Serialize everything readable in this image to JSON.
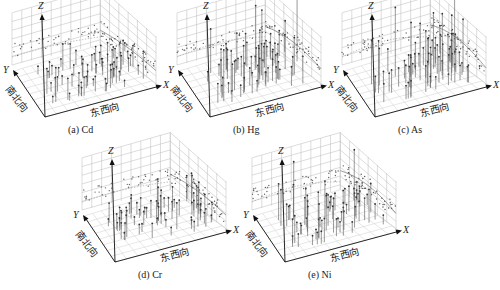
{
  "chart_data": [
    {
      "type": "scatter",
      "title": "(a) Cd",
      "panel_label": "(a)",
      "element": "Cd",
      "axes": {
        "x": "X",
        "y": "Y",
        "z": "Z"
      },
      "xlabel": "东西向",
      "ylabel": "南北向",
      "zlabel": "Z",
      "grid": true,
      "description": "3D trend analysis: sample points with vertical stems; projections on back walls show trend curves",
      "relative_stem_height": "low",
      "trend_xz": "slight downward arc",
      "trend_yz": "flat"
    },
    {
      "type": "scatter",
      "title": "(b) Hg",
      "panel_label": "(b)",
      "element": "Hg",
      "axes": {
        "x": "X",
        "y": "Y",
        "z": "Z"
      },
      "xlabel": "东西向",
      "ylabel": "南北向",
      "zlabel": "Z",
      "grid": true,
      "relative_stem_height": "high",
      "trend_xz": "inverted-U arc",
      "trend_yz": "rising"
    },
    {
      "type": "scatter",
      "title": "(c) As",
      "panel_label": "(c)",
      "element": "As",
      "axes": {
        "x": "X",
        "y": "Y",
        "z": "Z"
      },
      "xlabel": "东西向",
      "ylabel": "南北向",
      "zlabel": "Z",
      "grid": true,
      "relative_stem_height": "high",
      "trend_xz": "inverted-U arc",
      "trend_yz": "inverted-U arc"
    },
    {
      "type": "scatter",
      "title": "(d) Cr",
      "panel_label": "(d)",
      "element": "Cr",
      "axes": {
        "x": "X",
        "y": "Y",
        "z": "Z"
      },
      "xlabel": "东西向",
      "ylabel": "南北向",
      "zlabel": "Z",
      "grid": true,
      "relative_stem_height": "low",
      "trend_xz": "slight inverted-U arc",
      "trend_yz": "flat"
    },
    {
      "type": "scatter",
      "title": "(e) Ni",
      "panel_label": "(e)",
      "element": "Ni",
      "axes": {
        "x": "X",
        "y": "Y",
        "z": "Z"
      },
      "xlabel": "东西向",
      "ylabel": "南北向",
      "zlabel": "Z",
      "grid": true,
      "relative_stem_height": "medium",
      "trend_xz": "inverted-U arc, dropping toward X",
      "trend_yz": "flat"
    }
  ],
  "panels": [
    {
      "id": "a",
      "caption": "(a)  Cd",
      "x_label": "X",
      "y_label": "Y",
      "z_label": "Z",
      "ew_label": "东西向",
      "ns_label": "南北向",
      "left": 0,
      "top": 0,
      "stem_scale": 0.45,
      "seed": 11,
      "trend": 0.15
    },
    {
      "id": "b",
      "caption": "(b)  Hg",
      "x_label": "X",
      "y_label": "Y",
      "z_label": "Z",
      "ew_label": "东西向",
      "ns_label": "南北向",
      "left": 165,
      "top": 0,
      "stem_scale": 0.85,
      "seed": 23,
      "trend": 0.35
    },
    {
      "id": "c",
      "caption": "(c)  As",
      "x_label": "X",
      "y_label": "Y",
      "z_label": "Z",
      "ew_label": "东西向",
      "ns_label": "南北向",
      "left": 330,
      "top": 0,
      "stem_scale": 0.95,
      "seed": 37,
      "trend": 0.45
    },
    {
      "id": "d",
      "caption": "(d)  Cr",
      "x_label": "X",
      "y_label": "Y",
      "z_label": "Z",
      "ew_label": "东西向",
      "ns_label": "南北向",
      "left": 70,
      "top": 145,
      "stem_scale": 0.5,
      "seed": 51,
      "trend": 0.2
    },
    {
      "id": "e",
      "caption": "(e)  Ni",
      "x_label": "X",
      "y_label": "Y",
      "z_label": "Z",
      "ew_label": "东西向",
      "ns_label": "南北向",
      "left": 240,
      "top": 145,
      "stem_scale": 0.75,
      "seed": 67,
      "trend": 0.4
    }
  ]
}
